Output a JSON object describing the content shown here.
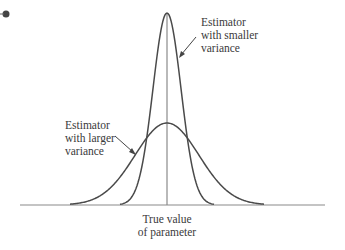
{
  "diagram": {
    "type": "probability-density-comparison",
    "bullet": true,
    "colors": {
      "curve": "#4a4a4a",
      "axis": "#8a8a8a",
      "center_line": "#8a8a8a",
      "text": "#3a3a3a"
    },
    "curves": [
      {
        "name": "narrow",
        "description": "Estimator with smaller variance",
        "peak_x": 167,
        "peak_y": 13,
        "spread": 14
      },
      {
        "name": "wide",
        "description": "Estimator with larger variance",
        "peak_x": 167,
        "peak_y": 123,
        "spread": 32
      }
    ]
  },
  "labels": {
    "smaller": {
      "line1": "Estimator",
      "line2": "with smaller",
      "line3": "variance"
    },
    "larger": {
      "line1": "Estimator",
      "line2": "with larger",
      "line3": "variance"
    },
    "true_value": {
      "line1": "True value",
      "line2": "of parameter"
    }
  }
}
